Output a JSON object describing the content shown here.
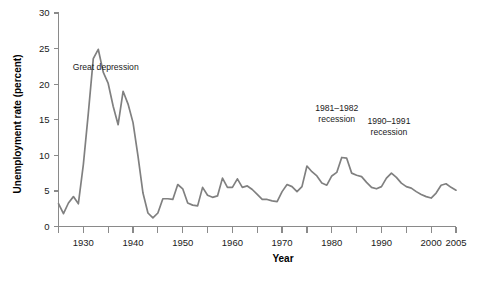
{
  "chart_data": {
    "type": "line",
    "title": "",
    "subtitle": "",
    "xlabel": "Year",
    "ylabel": "Unemployment rate (percent)",
    "xlim": [
      1925,
      2005
    ],
    "ylim": [
      0,
      30
    ],
    "grid": false,
    "legend": "none",
    "line_color": "#808080",
    "axis_color": "#8a8a8a",
    "x_ticks": [
      1925,
      1930,
      1935,
      1940,
      1945,
      1950,
      1955,
      1960,
      1965,
      1970,
      1975,
      1980,
      1985,
      1990,
      1995,
      2000,
      2005
    ],
    "x_tick_labels": [
      {
        "value": 1930,
        "label": "1930"
      },
      {
        "value": 1940,
        "label": "1940"
      },
      {
        "value": 1950,
        "label": "1950"
      },
      {
        "value": 1960,
        "label": "1960"
      },
      {
        "value": 1970,
        "label": "1970"
      },
      {
        "value": 1980,
        "label": "1980"
      },
      {
        "value": 1990,
        "label": "1990"
      },
      {
        "value": 2000,
        "label": "2000"
      },
      {
        "value": 2005,
        "label": "2005"
      }
    ],
    "y_ticks": [
      0,
      5,
      10,
      15,
      20,
      25,
      30
    ],
    "y_tick_labels": [
      "0",
      "5",
      "10",
      "15",
      "20",
      "25",
      "30"
    ],
    "annotations": [
      {
        "id": "great-depression",
        "lines": [
          "Great depression"
        ],
        "x": 1934.5,
        "y": 22.0
      },
      {
        "id": "recession-1981-1982",
        "lines": [
          "1981–1982",
          "recession"
        ],
        "x": 1981.0,
        "y": 16.2
      },
      {
        "id": "recession-1990-1991",
        "lines": [
          "1990–1991",
          "recession"
        ],
        "x": 1991.5,
        "y": 14.4
      }
    ],
    "series": [
      {
        "name": "Unemployment rate",
        "x": [
          1925,
          1926,
          1927,
          1928,
          1929,
          1930,
          1931,
          1932,
          1933,
          1934,
          1935,
          1936,
          1937,
          1938,
          1939,
          1940,
          1941,
          1942,
          1943,
          1944,
          1945,
          1946,
          1947,
          1948,
          1949,
          1950,
          1951,
          1952,
          1953,
          1954,
          1955,
          1956,
          1957,
          1958,
          1959,
          1960,
          1961,
          1962,
          1963,
          1964,
          1965,
          1966,
          1967,
          1968,
          1969,
          1970,
          1971,
          1972,
          1973,
          1974,
          1975,
          1976,
          1977,
          1978,
          1979,
          1980,
          1981,
          1982,
          1983,
          1984,
          1985,
          1986,
          1987,
          1988,
          1989,
          1990,
          1991,
          1992,
          1993,
          1994,
          1995,
          1996,
          1997,
          1998,
          1999,
          2000,
          2001,
          2002,
          2003,
          2004,
          2005
        ],
        "values": [
          3.2,
          1.8,
          3.3,
          4.2,
          3.2,
          8.7,
          15.9,
          23.6,
          24.9,
          21.7,
          20.1,
          16.9,
          14.3,
          19.0,
          17.2,
          14.6,
          9.9,
          4.7,
          1.9,
          1.2,
          1.9,
          3.9,
          3.9,
          3.8,
          5.9,
          5.3,
          3.3,
          3.0,
          2.9,
          5.5,
          4.4,
          4.1,
          4.3,
          6.8,
          5.5,
          5.5,
          6.7,
          5.5,
          5.7,
          5.2,
          4.5,
          3.8,
          3.8,
          3.6,
          3.5,
          4.9,
          5.9,
          5.6,
          4.9,
          5.6,
          8.5,
          7.7,
          7.1,
          6.1,
          5.8,
          7.1,
          7.6,
          9.7,
          9.6,
          7.5,
          7.2,
          7.0,
          6.2,
          5.5,
          5.3,
          5.6,
          6.8,
          7.5,
          6.9,
          6.1,
          5.6,
          5.4,
          4.9,
          4.5,
          4.2,
          4.0,
          4.7,
          5.8,
          6.0,
          5.5,
          5.1
        ]
      }
    ]
  },
  "axis_titles": {
    "x": "Year",
    "y": "Unemployment rate (percent)"
  }
}
